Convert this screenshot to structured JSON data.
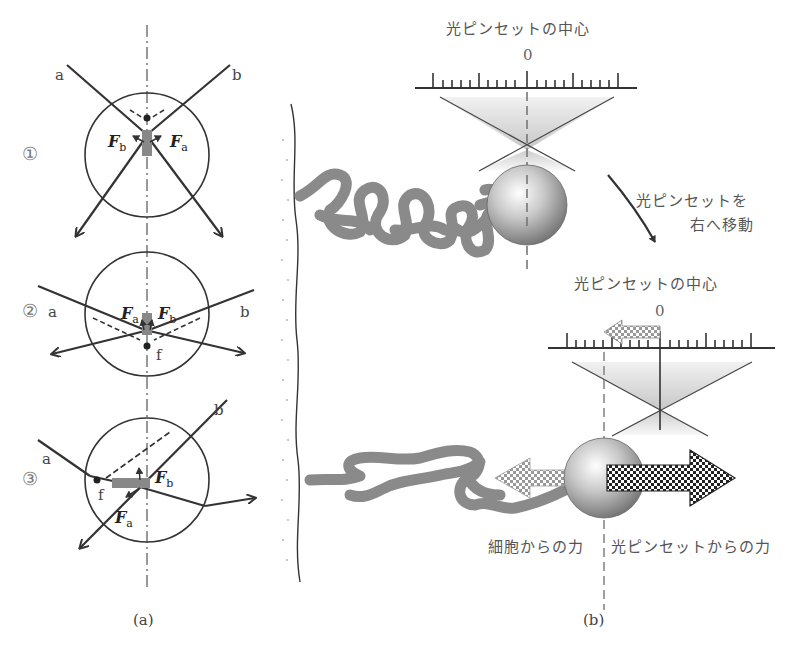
{
  "panel_a": {
    "caption": "(a)",
    "cases": [
      {
        "number": "①",
        "ray_a": "a",
        "ray_b": "b",
        "force_a": "F",
        "force_a_sub": "a",
        "force_b": "F",
        "force_b_sub": "b"
      },
      {
        "number": "②",
        "ray_a": "a",
        "ray_b": "b",
        "force_a": "F",
        "force_a_sub": "a",
        "force_b": "F",
        "force_b_sub": "b",
        "focus": "f"
      },
      {
        "number": "③",
        "ray_a": "a",
        "ray_b": "b",
        "force_a": "F",
        "force_a_sub": "a",
        "force_b": "F",
        "force_b_sub": "b",
        "focus": "f"
      }
    ]
  },
  "panel_b": {
    "caption": "(b)",
    "top": {
      "title": "光ピンセットの中心",
      "zero": "0"
    },
    "move_note": {
      "line1": "光ピンセットを",
      "line2": "右へ移動"
    },
    "bottom": {
      "title": "光ピンセットの中心",
      "zero": "0"
    },
    "force_cell": "細胞からの力",
    "force_tweezer": "光ピンセットからの力"
  },
  "colors": {
    "line": "#333333",
    "strand": "#8a8a8a",
    "text": "#444444"
  }
}
